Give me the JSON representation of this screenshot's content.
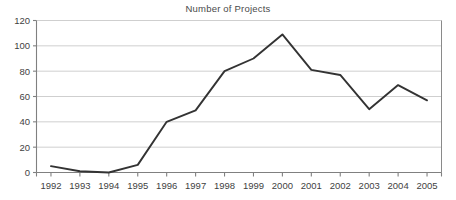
{
  "chart_data": {
    "type": "line",
    "title": "Number of Projects",
    "xlabel": "",
    "ylabel": "",
    "categories": [
      "1992",
      "1993",
      "1994",
      "1995",
      "1996",
      "1997",
      "1998",
      "1999",
      "2000",
      "2001",
      "2002",
      "2003",
      "2004",
      "2005"
    ],
    "values": [
      5,
      1,
      0,
      6,
      40,
      49,
      80,
      90,
      109,
      81,
      77,
      50,
      69,
      57
    ],
    "series": [
      {
        "name": "Number of Projects",
        "values": [
          5,
          1,
          0,
          6,
          40,
          49,
          80,
          90,
          109,
          81,
          77,
          50,
          69,
          57
        ]
      }
    ],
    "ylim": [
      0,
      120
    ],
    "ytick_labels": [
      "0",
      "20",
      "40",
      "60",
      "80",
      "100",
      "120"
    ],
    "ytick_values": [
      0,
      20,
      40,
      60,
      80,
      100,
      120
    ],
    "xtick_labels": [
      "1992",
      "1993",
      "1994",
      "1995",
      "1996",
      "1997",
      "1998",
      "1999",
      "2000",
      "2001",
      "2002",
      "2003",
      "2004",
      "2005"
    ],
    "grid": true,
    "grid_axis": "y",
    "legend": false,
    "legend_position": "none",
    "colors": {
      "line": "#333333",
      "grid": "#c9c9c9",
      "axis": "#808080",
      "text": "#3f3f3f",
      "background": "#ffffff"
    }
  }
}
